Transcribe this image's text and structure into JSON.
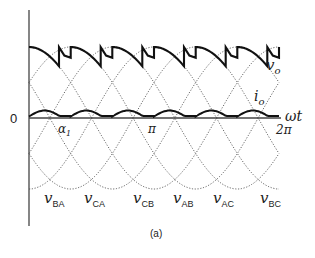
{
  "figure": {
    "caption": "(a)",
    "origin_label": "0",
    "x_axis_label": "ωt",
    "tick_labels": {
      "alpha": "α",
      "alpha_sub": "1",
      "pi": "π",
      "two_pi": "2π"
    },
    "curve_labels": {
      "vo": "v",
      "vo_sub": "o",
      "io": "i",
      "io_sub": "o"
    },
    "line_voltage_labels": [
      {
        "main": "v",
        "sub": "BA"
      },
      {
        "main": "v",
        "sub": "CA"
      },
      {
        "main": "v",
        "sub": "CB"
      },
      {
        "main": "v",
        "sub": "AB"
      },
      {
        "main": "v",
        "sub": "AC"
      },
      {
        "main": "v",
        "sub": "BC"
      }
    ]
  },
  "layout": {
    "origin_x": 29,
    "axis_y": 118,
    "px_per_pi": 125,
    "amplitude_px": 71,
    "alpha_x": 65,
    "colors": {
      "axis": "#444444",
      "dotted": "#555555",
      "trace": "#111111"
    }
  }
}
